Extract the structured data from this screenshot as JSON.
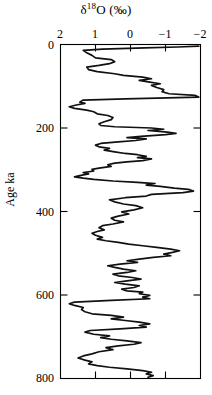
{
  "chart_data": {
    "type": "line",
    "title_parts": {
      "delta": "δ",
      "sup": "18",
      "element": "O",
      "units": "(‰)"
    },
    "xlabel": "δ18O (‰)",
    "ylabel": "Age ka",
    "xticks": [
      2,
      1,
      0,
      -1,
      -2
    ],
    "xtick_labels": [
      "2",
      "1",
      "0",
      "−1",
      "−2"
    ],
    "yticks": [
      0,
      200,
      400,
      600,
      800
    ],
    "ytick_labels": [
      "0",
      "200",
      "400",
      "600",
      "800"
    ],
    "xlim": [
      2,
      -2
    ],
    "ylim": [
      800,
      0
    ],
    "x_axis_inverted": true,
    "y_axis_inverted": true,
    "grid": false,
    "legend": null,
    "series": [
      {
        "name": "δ18O",
        "x_name": "δ18O (‰)",
        "y_name": "Age ka",
        "points": [
          [
            -1.95,
            4
          ],
          [
            -1.35,
            6
          ],
          [
            -0.4,
            8
          ],
          [
            0.8,
            11
          ],
          [
            1.35,
            14
          ],
          [
            1.25,
            20
          ],
          [
            1.1,
            26
          ],
          [
            1.0,
            32
          ],
          [
            0.55,
            36
          ],
          [
            0.45,
            41
          ],
          [
            0.6,
            46
          ],
          [
            0.9,
            50
          ],
          [
            1.25,
            54
          ],
          [
            1.2,
            60
          ],
          [
            0.95,
            65
          ],
          [
            0.45,
            70
          ],
          [
            0.2,
            74
          ],
          [
            -0.35,
            78
          ],
          [
            -0.6,
            82
          ],
          [
            -0.25,
            86
          ],
          [
            -0.55,
            90
          ],
          [
            -0.85,
            94
          ],
          [
            -0.6,
            98
          ],
          [
            -0.75,
            103
          ],
          [
            -0.95,
            108
          ],
          [
            -0.9,
            113
          ],
          [
            -1.1,
            118
          ],
          [
            -1.85,
            122
          ],
          [
            -1.95,
            126
          ],
          [
            0.15,
            130
          ],
          [
            1.35,
            133
          ],
          [
            1.45,
            138
          ],
          [
            1.3,
            141
          ],
          [
            1.55,
            145
          ],
          [
            1.75,
            149
          ],
          [
            1.6,
            153
          ],
          [
            1.25,
            157
          ],
          [
            1.05,
            161
          ],
          [
            0.95,
            166
          ],
          [
            0.65,
            170
          ],
          [
            0.5,
            175
          ],
          [
            0.55,
            180
          ],
          [
            0.75,
            185
          ],
          [
            0.9,
            190
          ],
          [
            0.85,
            194
          ],
          [
            0.45,
            197
          ],
          [
            -0.6,
            200
          ],
          [
            -0.95,
            203
          ],
          [
            -0.5,
            206
          ],
          [
            -1.05,
            210
          ],
          [
            -1.3,
            213
          ],
          [
            -1.0,
            216
          ],
          [
            -0.3,
            220
          ],
          [
            0.1,
            223
          ],
          [
            -0.45,
            226
          ],
          [
            -0.15,
            230
          ],
          [
            0.35,
            233
          ],
          [
            0.85,
            237
          ],
          [
            1.0,
            241
          ],
          [
            0.9,
            245
          ],
          [
            0.6,
            249
          ],
          [
            0.75,
            253
          ],
          [
            0.45,
            257
          ],
          [
            0.15,
            261
          ],
          [
            -0.2,
            264
          ],
          [
            -0.45,
            268
          ],
          [
            -0.2,
            271
          ],
          [
            -0.6,
            274
          ],
          [
            -0.35,
            278
          ],
          [
            0.1,
            281
          ],
          [
            0.45,
            284
          ],
          [
            0.65,
            288
          ],
          [
            0.55,
            292
          ],
          [
            0.9,
            296
          ],
          [
            1.1,
            299
          ],
          [
            1.05,
            303
          ],
          [
            1.35,
            307
          ],
          [
            1.2,
            310
          ],
          [
            1.45,
            314
          ],
          [
            1.6,
            317
          ],
          [
            1.35,
            320
          ],
          [
            1.05,
            323
          ],
          [
            0.5,
            327
          ],
          [
            -0.2,
            330
          ],
          [
            -0.7,
            333
          ],
          [
            -0.45,
            337
          ],
          [
            -0.85,
            340
          ],
          [
            -1.25,
            344
          ],
          [
            -1.65,
            347
          ],
          [
            -1.8,
            351
          ],
          [
            -1.5,
            355
          ],
          [
            -0.6,
            359
          ],
          [
            -0.45,
            363
          ],
          [
            0.15,
            367
          ],
          [
            0.6,
            372
          ],
          [
            0.45,
            377
          ],
          [
            0.2,
            382
          ],
          [
            -0.15,
            386
          ],
          [
            -0.35,
            391
          ],
          [
            -0.1,
            396
          ],
          [
            0.25,
            401
          ],
          [
            0.05,
            406
          ],
          [
            0.35,
            411
          ],
          [
            0.55,
            416
          ],
          [
            0.45,
            421
          ],
          [
            0.2,
            425
          ],
          [
            0.5,
            430
          ],
          [
            0.8,
            434
          ],
          [
            0.9,
            439
          ],
          [
            0.75,
            444
          ],
          [
            0.95,
            448
          ],
          [
            1.1,
            452
          ],
          [
            1.0,
            457
          ],
          [
            0.8,
            462
          ],
          [
            0.95,
            466
          ],
          [
            0.7,
            470
          ],
          [
            0.35,
            474
          ],
          [
            0.05,
            478
          ],
          [
            -0.35,
            482
          ],
          [
            -0.75,
            486
          ],
          [
            -1.15,
            490
          ],
          [
            -1.4,
            494
          ],
          [
            -1.2,
            498
          ],
          [
            -0.95,
            502
          ],
          [
            -1.15,
            506
          ],
          [
            -0.65,
            510
          ],
          [
            -0.25,
            514
          ],
          [
            0.1,
            518
          ],
          [
            -0.2,
            522
          ],
          [
            0.3,
            526
          ],
          [
            0.65,
            530
          ],
          [
            0.45,
            534
          ],
          [
            0.2,
            538
          ],
          [
            -0.15,
            542
          ],
          [
            0.1,
            546
          ],
          [
            0.5,
            550
          ],
          [
            0.35,
            554
          ],
          [
            -0.05,
            558
          ],
          [
            -0.3,
            562
          ],
          [
            0.1,
            566
          ],
          [
            0.45,
            570
          ],
          [
            0.15,
            574
          ],
          [
            -0.25,
            578
          ],
          [
            -0.1,
            582
          ],
          [
            0.25,
            586
          ],
          [
            0.1,
            590
          ],
          [
            -0.35,
            593
          ],
          [
            -0.25,
            597
          ],
          [
            -0.55,
            601
          ],
          [
            -0.35,
            605
          ],
          [
            -0.55,
            609
          ],
          [
            0.55,
            613
          ],
          [
            1.6,
            617
          ],
          [
            1.75,
            621
          ],
          [
            1.6,
            625
          ],
          [
            1.35,
            630
          ],
          [
            1.4,
            635
          ],
          [
            1.3,
            640
          ],
          [
            1.1,
            645
          ],
          [
            0.55,
            649
          ],
          [
            0.2,
            653
          ],
          [
            0.55,
            657
          ],
          [
            0.15,
            661
          ],
          [
            -0.25,
            665
          ],
          [
            -0.55,
            669
          ],
          [
            -0.25,
            673
          ],
          [
            -0.45,
            677
          ],
          [
            0.3,
            681
          ],
          [
            1.15,
            685
          ],
          [
            1.3,
            689
          ],
          [
            1.05,
            694
          ],
          [
            0.6,
            698
          ],
          [
            0.85,
            702
          ],
          [
            0.55,
            706
          ],
          [
            0.1,
            710
          ],
          [
            -0.3,
            714
          ],
          [
            -0.1,
            718
          ],
          [
            0.35,
            722
          ],
          [
            0.7,
            726
          ],
          [
            0.5,
            731
          ],
          [
            0.9,
            736
          ],
          [
            1.1,
            741
          ],
          [
            1.35,
            746
          ],
          [
            1.5,
            751
          ],
          [
            1.3,
            756
          ],
          [
            1.1,
            760
          ],
          [
            1.2,
            765
          ],
          [
            0.95,
            769
          ],
          [
            0.6,
            773
          ],
          [
            0.1,
            777
          ],
          [
            -0.35,
            781
          ],
          [
            -0.6,
            785
          ],
          [
            -0.45,
            789
          ],
          [
            -0.65,
            793
          ],
          [
            -0.5,
            797
          ]
        ]
      }
    ]
  },
  "axes": {
    "title": "δ18O (‰)",
    "ylabel": "Age ka",
    "xtick_labels": [
      "2",
      "1",
      "0",
      "−1",
      "−2"
    ],
    "ytick_labels": [
      "0",
      "200",
      "400",
      "600",
      "800"
    ]
  },
  "colors": {
    "curve": "#111111",
    "frame": "#000000",
    "background": "#ffffff"
  }
}
